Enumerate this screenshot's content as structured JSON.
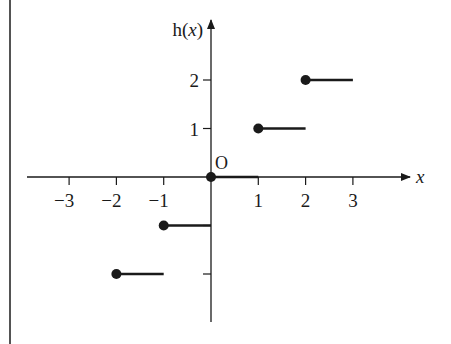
{
  "chart_data": {
    "type": "line",
    "subtype": "step-function",
    "title": "",
    "xlabel": "x",
    "ylabel": "h(x)",
    "origin_label": "O",
    "xlim": [
      -3.6,
      4.2
    ],
    "ylim": [
      -3.0,
      3.3
    ],
    "x_ticks": [
      -3,
      -2,
      -1,
      1,
      2,
      3
    ],
    "x_tick_labels": [
      "−3",
      "−2",
      "−1",
      "1",
      "2",
      "3"
    ],
    "y_ticks": [
      -2,
      -1,
      1,
      2
    ],
    "y_tick_labels": [
      "",
      "",
      "1",
      "2"
    ],
    "grid": false,
    "legend": null,
    "segments": [
      {
        "x_start": -2,
        "x_end": -1,
        "y": -2,
        "closed_start": true,
        "open_end": true
      },
      {
        "x_start": -1,
        "x_end": 0,
        "y": -1,
        "closed_start": true,
        "open_end": true
      },
      {
        "x_start": 0,
        "x_end": 1,
        "y": 0,
        "closed_start": true,
        "open_end": true
      },
      {
        "x_start": 1,
        "x_end": 2,
        "y": 1,
        "closed_start": true,
        "open_end": true
      },
      {
        "x_start": 2,
        "x_end": 3,
        "y": 2,
        "closed_start": true,
        "open_end": true
      }
    ]
  },
  "colors": {
    "ink": "#1a1a1a",
    "background": "#ffffff"
  }
}
